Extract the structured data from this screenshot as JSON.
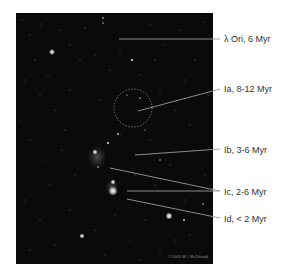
{
  "figure": {
    "labels": [
      {
        "id": "lambda-ori",
        "text": "λ Ori, 6 Myr",
        "y": 34,
        "line": [
          [
            119,
            39
          ],
          [
            220,
            39
          ]
        ]
      },
      {
        "id": "ia",
        "text": "Ia, 8-12 Myr",
        "y": 84,
        "line": [
          [
            138,
            111
          ],
          [
            220,
            89
          ]
        ]
      },
      {
        "id": "ib",
        "text": "Ib, 3-6 Myr",
        "y": 145,
        "line": [
          [
            135,
            155
          ],
          [
            220,
            149
          ]
        ]
      },
      {
        "id": "ic",
        "text": "Ic, 2-6 Myr",
        "y": 187,
        "lines": [
          [
            [
              110,
              168
            ],
            [
              220,
              191
            ]
          ],
          [
            [
              127,
              191
            ],
            [
              220,
              191
            ]
          ]
        ]
      },
      {
        "id": "id",
        "text": "Id, < 2 Myr",
        "y": 214,
        "line": [
          [
            127,
            199
          ],
          [
            220,
            218
          ]
        ]
      }
    ],
    "copyright": "© 2005 W. / McDonald",
    "colors": {
      "sky": "#0a0a0a",
      "leader_line": "#9a9a9a",
      "label_text": "#333333",
      "star": "#ffffff"
    }
  }
}
